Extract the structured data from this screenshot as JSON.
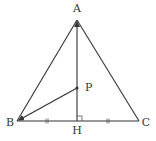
{
  "diagram": {
    "points": {
      "A": {
        "label": "A",
        "x": 77,
        "y": 20,
        "label_x": 77,
        "label_y": 12
      },
      "B": {
        "label": "B",
        "x": 17,
        "y": 121,
        "label_x": 9,
        "label_y": 126
      },
      "C": {
        "label": "C",
        "x": 139,
        "y": 121,
        "label_x": 146,
        "label_y": 126
      },
      "H": {
        "label": "H",
        "x": 77,
        "y": 121,
        "label_x": 77,
        "label_y": 133
      },
      "P": {
        "label": "P",
        "x": 77,
        "y": 88,
        "label_x": 85,
        "label_y": 91
      }
    },
    "segments": [
      {
        "from": "A",
        "to": "B"
      },
      {
        "from": "A",
        "to": "C"
      },
      {
        "from": "B",
        "to": "C"
      },
      {
        "from": "H",
        "to": "A",
        "arrow": "end"
      },
      {
        "from": "P",
        "to": "B",
        "arrow": "end"
      }
    ],
    "marks": {
      "equal_ticks": [
        "BH",
        "HC"
      ],
      "right_angle": "AHC"
    },
    "colors": {
      "stroke": "#333333",
      "text": "#333333",
      "background": "#ffffff"
    }
  }
}
